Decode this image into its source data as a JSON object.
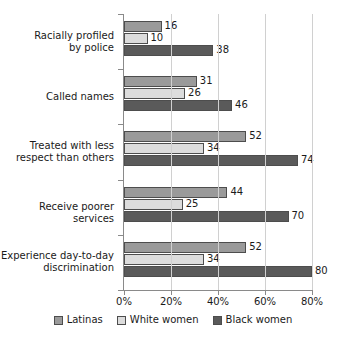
{
  "chart_data": {
    "type": "bar",
    "orientation": "horizontal",
    "title": "",
    "xlabel": "",
    "ylabel": "",
    "xlim": [
      0,
      80
    ],
    "grid": true,
    "legend_position": "bottom",
    "categories": [
      "Racially profiled by police",
      "Called names",
      "Treated with less respect than others",
      "Receive poorer services",
      "Experience day-to-day discrimination"
    ],
    "category_lines": [
      [
        "Racially profiled",
        "by police"
      ],
      [
        "Called names"
      ],
      [
        "Treated with less",
        "respect than others"
      ],
      [
        "Receive poorer services"
      ],
      [
        "Experience day-to-day",
        "discrimination"
      ]
    ],
    "tick_labels": [
      "0%",
      "20%",
      "40%",
      "60%",
      "80%"
    ],
    "tick_values": [
      0,
      20,
      40,
      60,
      80
    ],
    "series": [
      {
        "name": "Latinas",
        "color": "#9a9a9a",
        "values": [
          16,
          31,
          52,
          44,
          52
        ]
      },
      {
        "name": "White women",
        "color": "#dcdcdc",
        "values": [
          10,
          26,
          34,
          25,
          34
        ]
      },
      {
        "name": "Black women",
        "color": "#5a5a5a",
        "values": [
          38,
          46,
          74,
          70,
          80
        ]
      }
    ]
  },
  "legend": {
    "items": [
      {
        "label": "Latinas"
      },
      {
        "label": "White women"
      },
      {
        "label": "Black women"
      }
    ]
  }
}
